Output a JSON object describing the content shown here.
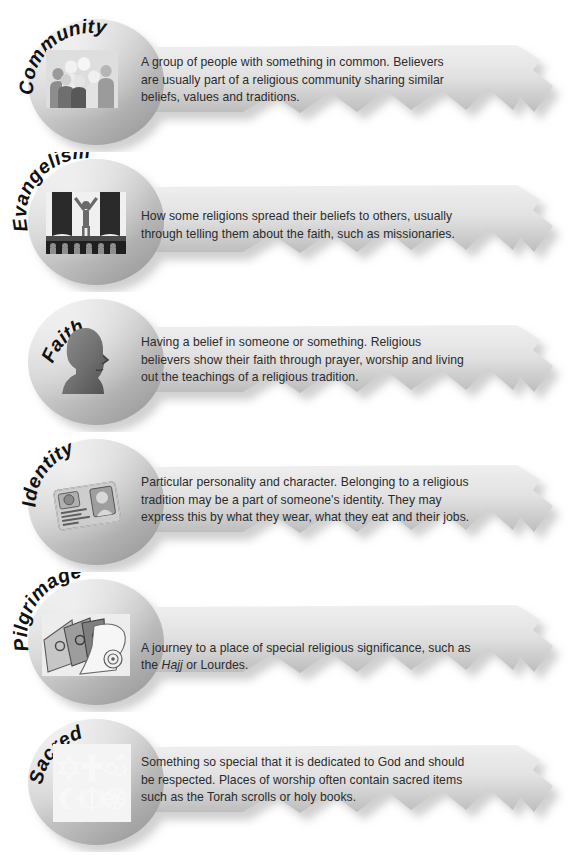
{
  "page": {
    "background_color": "#ffffff",
    "text_color": "#2b2b2b",
    "key_body_light": "#e9e9e9",
    "key_body_dark": "#9a9a9a",
    "shadow_color": "#a8a8a8"
  },
  "keys": [
    {
      "id": "community",
      "title": "Community",
      "icon": "crowd-of-people-icon",
      "description": "A group of people with something in common. Believers are usually part of a religious community sharing similar beliefs, values and traditions.",
      "description_lines": [
        "A group of people with something in common. Believers are",
        "usually part of a religious community sharing similar beliefs,",
        "values and traditions."
      ]
    },
    {
      "id": "evangelism",
      "title": "Evangelism",
      "icon": "preacher-on-stage-icon",
      "description": "How some religions spread their beliefs to others, usually through telling them about the faith, such as missionaries.",
      "description_lines": [
        "How some religions spread their beliefs to others, usually",
        "through telling them about the faith, such as missionaries."
      ]
    },
    {
      "id": "faith",
      "title": "Faith",
      "icon": "head-profile-silhouette-icon",
      "description": "Having a belief in someone or something. Religious believers show their faith through prayer, worship and living out the teachings of a religious tradition.",
      "description_lines": [
        "Having a belief in someone or something. Religious believers",
        "show their faith through prayer, worship and living out the",
        "teachings of a religious tradition."
      ]
    },
    {
      "id": "identity",
      "title": "Identity",
      "icon": "id-card-icon",
      "description": "Particular personality and character. Belonging to a religious tradition may be a part of someone's identity. They may express this by what they wear, what they eat and their jobs.",
      "description_lines": [
        "Particular personality and character. Belonging to a religious",
        "tradition may be a part of someone's identity. They may express",
        "this by what they wear, what they eat and their jobs."
      ]
    },
    {
      "id": "pilgrimage",
      "title": "Pilgrimage",
      "icon": "books-and-scroll-icon",
      "description": "A journey to a place of special religious significance, such as the Hajj or Lourdes.",
      "description_html": "A journey to a place of special religious significance, such as\nthe <i>Hajj</i> or Lourdes.",
      "description_lines": [
        "A journey to a place of special religious significance, such as",
        "the Hajj or Lourdes."
      ],
      "italic_words": [
        "Hajj"
      ]
    },
    {
      "id": "sacred",
      "title": "Sacred",
      "icon": "religious-symbols-grid-icon",
      "description": "Something so special that it is dedicated to God and should be respected. Places of worship often contain sacred items such as the Torah scrolls or holy books.",
      "description_lines": [
        "Something so special that it is dedicated to God and should",
        "be respected. Places of worship often contain sacred items such",
        "as the Torah scrolls or holy books."
      ],
      "symbols": [
        "star-of-david",
        "cross",
        "om",
        "crescent-and-star",
        "khanda",
        "dharma-wheel"
      ]
    }
  ]
}
